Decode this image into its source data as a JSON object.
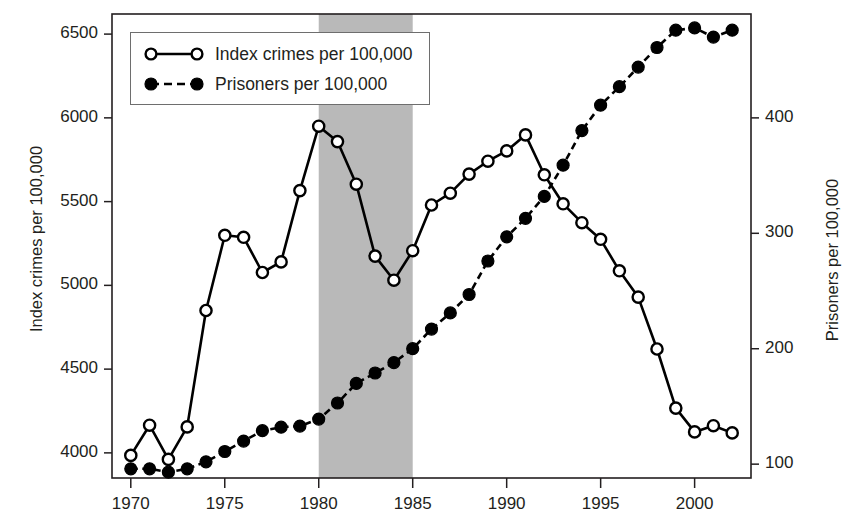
{
  "chart_data": {
    "type": "line",
    "title": "",
    "xlabel": "",
    "ylabel": "Index crimes per 100,000",
    "y2label": "Prisoners per 100,000",
    "xlim": [
      1969,
      2003
    ],
    "ylim": [
      3850,
      6620
    ],
    "y2lim": [
      88,
      490
    ],
    "grid": false,
    "legend_position": "top-left",
    "xticks": [
      "1970",
      "1975",
      "1980",
      "1985",
      "1990",
      "1995",
      "2000"
    ],
    "xtick_values": [
      1970,
      1975,
      1980,
      1985,
      1990,
      1995,
      2000
    ],
    "yticks": [
      "4000",
      "4500",
      "5000",
      "5500",
      "6000",
      "6500"
    ],
    "ytick_values": [
      4000,
      4500,
      5000,
      5500,
      6000,
      6500
    ],
    "y2ticks": [
      "100",
      "200",
      "300",
      "400"
    ],
    "y2tick_values": [
      100,
      200,
      300,
      400
    ],
    "shaded_region": {
      "label": "",
      "x_start": 1980,
      "x_end": 1985,
      "color": "#b9b9b9"
    },
    "x": [
      1970,
      1971,
      1972,
      1973,
      1974,
      1975,
      1976,
      1977,
      1978,
      1979,
      1980,
      1981,
      1982,
      1983,
      1984,
      1985,
      1986,
      1987,
      1988,
      1989,
      1990,
      1991,
      1992,
      1993,
      1994,
      1995,
      1996,
      1997,
      1998,
      1999,
      2000,
      2001,
      2002
    ],
    "series": [
      {
        "name": "Index crimes per 100,000",
        "axis": "left",
        "marker": "open-circle",
        "linestyle": "solid",
        "color": "#000000",
        "values": [
          3985,
          4165,
          3961,
          4155,
          4850,
          5299,
          5287,
          5077,
          5140,
          5566,
          5950,
          5858,
          5604,
          5175,
          5031,
          5207,
          5480,
          5550,
          5664,
          5741,
          5803,
          5898,
          5660,
          5487,
          5374,
          5275,
          5087,
          4930,
          4620,
          4267,
          4125,
          4162,
          4119
        ]
      },
      {
        "name": "Prisoners per 100,000",
        "axis": "right",
        "marker": "filled-circle",
        "linestyle": "dashed",
        "color": "#000000",
        "values": [
          96,
          96,
          93,
          96,
          102,
          111,
          120,
          129,
          132,
          133,
          139,
          153,
          170,
          179,
          188,
          200,
          217,
          231,
          247,
          276,
          297,
          313,
          332,
          359,
          389,
          411,
          427,
          444,
          461,
          476,
          478,
          470,
          476
        ]
      }
    ]
  },
  "legend": {
    "entries": [
      {
        "label": "Index crimes per 100,000",
        "marker": "open-circle",
        "linestyle": "solid"
      },
      {
        "label": "Prisoners per 100,000",
        "marker": "filled-circle",
        "linestyle": "dashed"
      }
    ]
  },
  "axes": {
    "left_title": "Index crimes per 100,000",
    "right_title": "Prisoners per 100,000"
  }
}
